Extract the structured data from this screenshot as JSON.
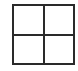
{
  "icon": {
    "name": "grid-2x2-icon",
    "rows": 2,
    "cols": 2,
    "stroke_color": "#2a2a2a",
    "background": "#ffffff"
  }
}
